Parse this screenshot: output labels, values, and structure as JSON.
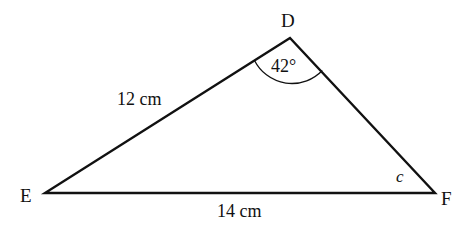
{
  "diagram": {
    "type": "triangle",
    "vertices": {
      "D": {
        "label": "D",
        "x": 290,
        "y": 38
      },
      "E": {
        "label": "E",
        "x": 45,
        "y": 193
      },
      "F": {
        "label": "F",
        "x": 435,
        "y": 193
      }
    },
    "sides": {
      "DE": {
        "label": "12 cm"
      },
      "EF": {
        "label": "14 cm"
      }
    },
    "angles": {
      "D": {
        "label": "42°"
      },
      "F": {
        "label": "c"
      }
    },
    "colors": {
      "stroke": "#111111",
      "background": "#ffffff"
    }
  }
}
